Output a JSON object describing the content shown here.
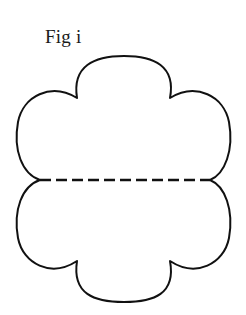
{
  "figure": {
    "caption": "Fig i",
    "background_color": "#ffffff",
    "stroke_color": "#111111",
    "fill_color": "#ffffff",
    "outline_stroke_width": 2,
    "fold_line": {
      "label": "fold-line",
      "style": "dashed",
      "stroke_color": "#111111",
      "stroke_width": 2.4,
      "dash_length": 11,
      "dash_gap": 5,
      "x_start": 40,
      "x_end": 210,
      "y": 180
    },
    "shape": {
      "name": "six-petal-scalloped-flower",
      "petal_count": 6,
      "center_x": 124,
      "center_y": 180,
      "bounds": {
        "left": 17,
        "top": 56,
        "right": 232,
        "bottom": 302
      },
      "petal_labels": [
        "petal-top-center",
        "petal-upper-right",
        "petal-lower-right",
        "petal-bottom-center",
        "petal-lower-left",
        "petal-upper-left"
      ],
      "cusp_points": [
        {
          "name": "cusp-upper-left",
          "x": 77,
          "y": 98
        },
        {
          "name": "cusp-upper-right",
          "x": 170,
          "y": 98
        },
        {
          "name": "cusp-right",
          "x": 210,
          "y": 180
        },
        {
          "name": "cusp-lower-right",
          "x": 170,
          "y": 261
        },
        {
          "name": "cusp-lower-left",
          "x": 77,
          "y": 261
        },
        {
          "name": "cusp-left",
          "x": 40,
          "y": 180
        }
      ]
    }
  }
}
